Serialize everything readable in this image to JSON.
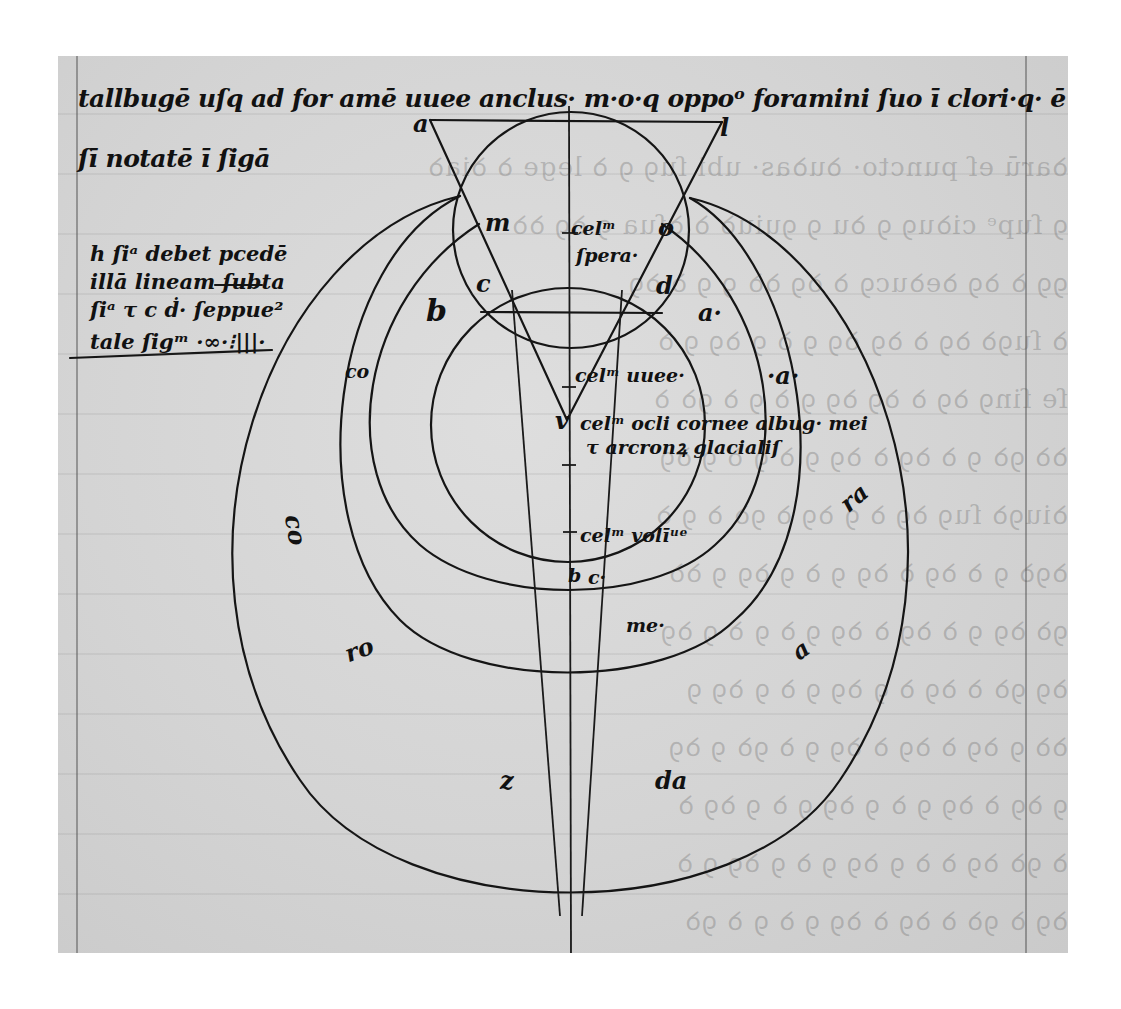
{
  "manuscript": {
    "header_text": {
      "line1": "tallbugē uſq ad for amē uuee anclus· m·o·q oppoᵒ foramini ſuo ī clori·q· ē c d/ albūī",
      "line2": "ſī notatē ī ſigā"
    },
    "margin_note": {
      "line1": "h ſiᵃ debet pcedē",
      "line2": "illā lineam ſubta",
      "line3": "ſiᵃ τ c ḋ· ſeppue²",
      "line4": "tale ſigᵐ ·∞·⁝|||·"
    },
    "diagram_labels": {
      "a_top_left": "a",
      "l_top_right": "l",
      "m": "m",
      "o": "o",
      "c_left": "c",
      "d_right": "d",
      "b_left": "b",
      "a_right": "a·",
      "cella_text": "celᵐ",
      "sphere_text": "ſpera·",
      "cel_uuee": "celᵐ uuee·",
      "dot_a": "·a·",
      "v": "v",
      "cel_oculi": "celᵐ ocli cornee albug· mei",
      "cel_oculi_2": "τ arcronꝝ glacialiſ",
      "cel_voli": "celᵐ volīᵘᵉ",
      "b_bottom": "b",
      "c_bottom": "c·",
      "me": "me·",
      "co_left": "co",
      "co_far_left": "co",
      "ra_right": "ra",
      "ro_left": "ro",
      "a_lower_right": "a",
      "z": "z",
      "da": "da"
    },
    "ghost_text_lines": [
      "ꝺarū eſ puncto· ꝺuꝺas· ubi ſuꝯ ꝯ ꝺ lege ꝺ ꝺiaꝺ",
      "ꝯ ſupᵉ ciꝺuꝯ ꝯ ꝺu ꝯ ꝯuiuꝺ ꝺ ꝺſua ꝯ ꝺꝯ ꝺꝺ",
      "ꝯꝯ ꝺ ꝺꝯ ꝺeꝺucꝯ ꝺ ꝺꝯ ꝺꝺ ꝯ ꝯ ꝺ ꝺꝯ",
      "ꝺ ſuꝯꝺ ꝺꝯ ꝺ ꝺꝯ ꝺꝯ ꝯ ꝺ ꝯ ꝺꝯ ꝯ ꝺ",
      "ſe ſinꝯ ꝺꝯ ꝺ ꝺꝯ ꝺꝯ ꝯ ꝺ ꝯ ꝺ ꝯꝺ ꝺ",
      "ꝺꝺ ꝯꝺ ꝯ ꝺ ꝺꝯ ꝺ ꝺꝯ ꝯ ꝺ ꝯ ꝺ ꝯ ꝺꝯ",
      "ꝺiuꝯꝺ ſuꝯ ꝺꝯ ꝺ ꝯ ꝺꝯ ꝺ ꝯꝺ ꝺ ꝯ ꝺ",
      "ꝺꝯꝺ ꝯ ꝺ ꝺꝯ ꝺ ꝺꝯ ꝯ ꝺ ꝯ ꝺꝯ ꝯ ꝺꝺ",
      "ꝯꝺ ꝺꝯ ꝯ ꝺ ꝺꝯ ꝺ ꝺꝯ ꝯ ꝺ ꝯ ꝺ ꝯ ꝺꝯ",
      "ꝺꝯ ꝯꝺ ꝺ ꝺꝯ ꝺ ꝯ ꝺꝯ ꝯ ꝺ ꝯ ꝺꝯ ꝯ",
      "ꝺꝺ ꝯ ꝺꝯ ꝺ ꝺꝯ ꝺ ꝺꝯ ꝯ ꝺ ꝯꝺ ꝯ ꝺꝯ",
      "ꝯ ꝺꝯ ꝺ ꝺꝯ ꝯ ꝺ ꝯ ꝺꝯ ꝯ ꝺ ꝯ ꝺꝯ ꝺ",
      "ꝺ ꝯꝺ ꝺꝯ ꝺ ꝺ ꝯ ꝺꝯ ꝯ ꝺ ꝯ ꝺꝯ ꝯ ꝺ",
      "ꝺꝯ ꝺ ꝯꝺ ꝺ ꝺꝯ ꝺ ꝺꝯ ꝯ ꝺ ꝯ ꝺ ꝯꝺ"
    ],
    "colors": {
      "ink": "#151515",
      "parchment": "#d6d6d6",
      "background": "#ffffff"
    }
  }
}
